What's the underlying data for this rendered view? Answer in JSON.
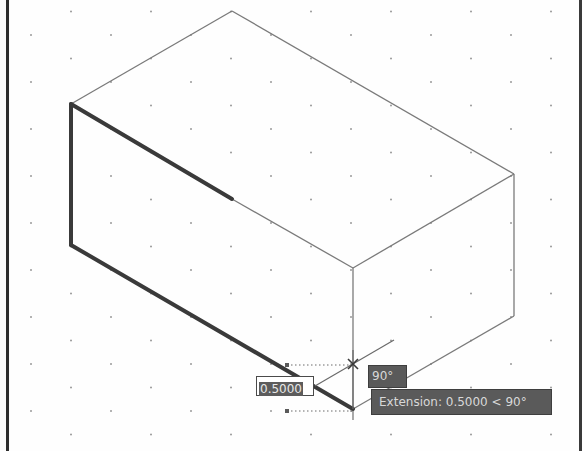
{
  "app": {
    "type": "CAD drawing viewport (isometric)",
    "grid": {
      "style": "isometric dots",
      "dx": 80,
      "dy": 23.5,
      "color": "#8a8a8a"
    }
  },
  "drawing": {
    "object": "isometric box",
    "vertices": {
      "top_back": [
        232,
        11
      ],
      "left_top": [
        71,
        104
      ],
      "left_bottom": [
        71,
        245
      ],
      "front_top": [
        353,
        268
      ],
      "right_top": [
        514,
        174
      ],
      "right_bottom": [
        514,
        316
      ],
      "front_bottom": [
        353,
        409
      ]
    },
    "highlighted_edges_color": "#3a3a3a",
    "edge_color": "#7a7a7a"
  },
  "dynamic_input": {
    "value": "0.5000"
  },
  "tooltips": {
    "angle": "90°",
    "extension": "Extension: 0.5000 < 90°"
  }
}
